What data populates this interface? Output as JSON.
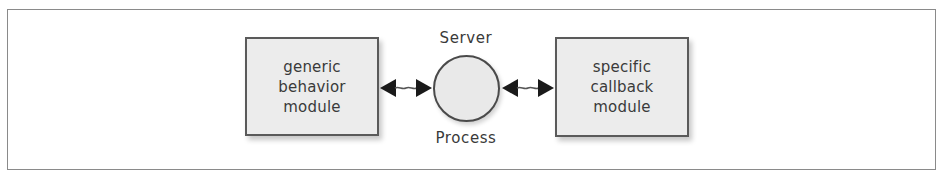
{
  "diagram": {
    "left_module": {
      "lines": [
        "generic",
        "behavior",
        "module"
      ]
    },
    "server": {
      "label_top": "Server",
      "label_bottom": "Process"
    },
    "right_module": {
      "lines": [
        "specific",
        "callback",
        "module"
      ]
    },
    "connections": [
      {
        "from": "left_module",
        "to": "server",
        "type": "bidirectional-arrow"
      },
      {
        "from": "server",
        "to": "right_module",
        "type": "bidirectional-arrow"
      }
    ],
    "colors": {
      "box_fill": "#ececec",
      "box_border": "#5a5a5a",
      "arrow": "#1a1a1a",
      "text": "#3a3a3a",
      "frame_border": "#8a8a8a"
    }
  }
}
